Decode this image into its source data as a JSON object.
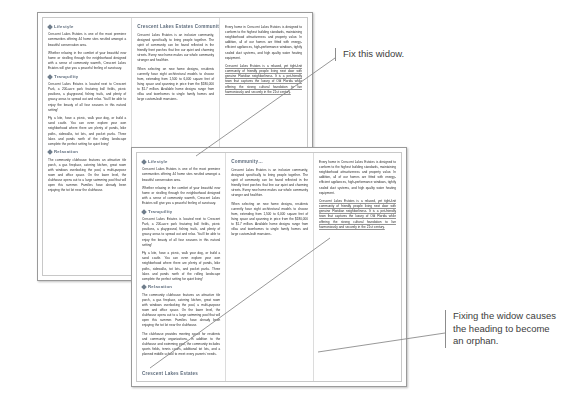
{
  "doc": {
    "brand": "Crescent Lakes Estates",
    "column_heading_top": "Crescent Lakes Estates Community…",
    "column_heading_bottom": "Community…",
    "footer_heading": "Crescent Lakes Estates",
    "sections": [
      {
        "id": "lifestyle",
        "heading": "Lifestyle"
      },
      {
        "id": "tranquility",
        "heading": "Tranquility"
      },
      {
        "id": "relaxation",
        "heading": "Relaxation"
      }
    ],
    "paragraphs": {
      "lifestyle_1": "Crescent Lakes Estates is one of the most premiere communities offering 44 home sites nestled amongst a beautiful conservation area.",
      "lifestyle_2": "Whether relaxing in the comfort of your beautiful new home or strolling through the neighborhood designed with a sense of community warmth, Crescent Lakes Estates will give you a peaceful feeling of sanctuary.",
      "tranquility_1": "Crescent Lakes Estates is located next to Crescent Park, a 200-acre park featuring ball fields, picnic pavilions, a playground, fishing trails, and plenty of grassy areas to spread out and relax. You'll be able to enjoy the beauty of all four seasons in this natural setting!",
      "tranquility_2": "Fly a kite, have a picnic, walk your dog, or build a sand castle. You can even explore your own neighborhood where there are plenty of ponds, bike paths, sidewalks, tot lots, and pocket parks. Three lakes and ponds north of the rolling landscape complete the perfect setting for quiet living!",
      "relaxation_1": "The community clubhouse features an attractive tile porch, a gas fireplace, catering kitchen, great room with windows overlooking the pool, a multi-purpose room and office space. On the lower level, the clubhouse opens out to a large swimming pool that will open this summer. Families have already been enjoying the tot lot near the clubhouse.",
      "relaxation_2": "The clubhouse provides meeting space for residents and community organizations. In addition to the clubhouse and swimming pool, the community includes sports fields, tennis courts, additional tot lots, and a planned middle school to meet every parents' needs.",
      "community_1": "Crescent Lakes Estates is an inclusive community, designed specifically to bring people together. The spirit of community can be found reflected in the friendly front porches that line our quiet and charming streets. Every new home makes our whole community stronger and healthier.",
      "community_2": "When selecting on new home designs, residents currently have eight architectural models to choose from, extending from 1,500 to 6,000 square feet of living space and spanning in price from the $180,000 to $1.7 million. Available home designs range from villas and townhomes to single family homes and large custom-built mansions.",
      "every_1": "Every home in Crescent Lakes Estates is designed to conform to the highest building standards, maintaining neighborhood attractiveness and property value. In addition, all of our homes are fitted with energy-efficient appliances, high-performance windows, tightly sealed duct systems, and high quality water heating equipment.",
      "every_2": "Crescent Lakes Estates is a relaxed, yet tight-knit community of friendly people living next door with genuine Floridian neighborliness. It is a pet-friendly town that captures the luxury of Old Florida while offering the strong cultural foundation to live harmoniously and securely in the 21st century."
    }
  },
  "annotations": {
    "widow_note": "Fix this widow.",
    "orphan_note": "Fixing the widow causes the heading to become an orphan."
  },
  "colors": {
    "heading": "#5f6d7d",
    "body": "#2b2b2b",
    "page_border": "#9a9a9a",
    "leader": "#8c8c8c"
  }
}
